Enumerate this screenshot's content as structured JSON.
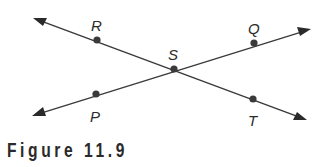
{
  "figure": {
    "caption": "Figure 11.9",
    "colors": {
      "line": "#3a3a3a",
      "text": "#2a2a2a",
      "background": "#ffffff"
    }
  },
  "diagram": {
    "lines": [
      {
        "name": "line-RT",
        "through": [
          "R",
          "S",
          "T"
        ],
        "start": [
          33,
          18
        ],
        "end": [
          307,
          120
        ]
      },
      {
        "name": "line-PQ",
        "through": [
          "P",
          "S",
          "Q"
        ],
        "start": [
          32,
          116
        ],
        "end": [
          311,
          29
        ]
      }
    ],
    "points": [
      {
        "label": "R",
        "x": 97,
        "y": 40,
        "label_x": 92,
        "label_y": 30
      },
      {
        "label": "Q",
        "x": 254,
        "y": 43,
        "label_x": 249,
        "label_y": 33
      },
      {
        "label": "S",
        "x": 174,
        "y": 69,
        "label_x": 169,
        "label_y": 59
      },
      {
        "label": "P",
        "x": 96,
        "y": 94,
        "label_x": 90,
        "label_y": 122
      },
      {
        "label": "T",
        "x": 253,
        "y": 99,
        "label_x": 248,
        "label_y": 126
      }
    ]
  }
}
